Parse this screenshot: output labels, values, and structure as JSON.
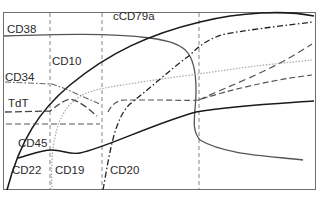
{
  "diagram": {
    "type": "marker-expression-timeline",
    "colors": {
      "frame": "#6e6e6e",
      "black_line": "#1a1a1a",
      "gray_line": "#555555",
      "dotted_line": "#a8a8a8",
      "text": "#2a2a2a"
    },
    "labels": {
      "cd38": "CD38",
      "ccd79a": "cCD79a",
      "cd10": "CD10",
      "cd34": "CD34",
      "tdt": "TdT",
      "cd45": "CD45",
      "cd22": "CD22",
      "cd19": "CD19",
      "cd20": "CD20"
    },
    "stage_dividers_x": [
      50,
      102,
      199
    ],
    "curves": [
      {
        "name": "CD38",
        "style": "solid-gray"
      },
      {
        "name": "cCD79a",
        "style": "solid-black-thick"
      },
      {
        "name": "CD34",
        "style": "dash-dot"
      },
      {
        "name": "TdT",
        "style": "long-dash"
      },
      {
        "name": "CD10",
        "style": "dotted"
      },
      {
        "name": "CD22",
        "style": "dashed"
      },
      {
        "name": "CD19",
        "style": "dotted-gray"
      },
      {
        "name": "CD20",
        "style": "dash-dot-black"
      },
      {
        "name": "CD45",
        "style": "solid-black"
      }
    ]
  }
}
